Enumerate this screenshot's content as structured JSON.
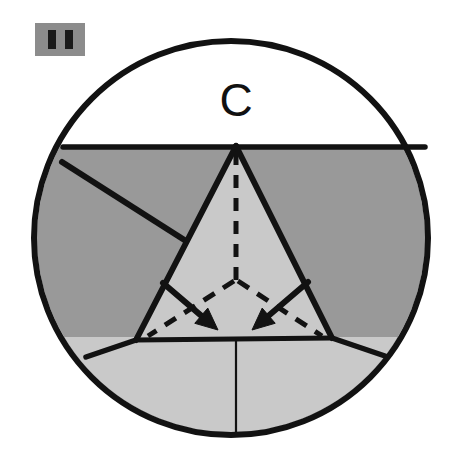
{
  "figure": {
    "step_label": "C",
    "badge": {
      "name": "pause-badge",
      "bars": 2,
      "background_color": "#8c8c8c",
      "bar_color": "#1a1a1a"
    },
    "colors": {
      "outline": "#121212",
      "paper_white": "#ffffff",
      "paper_dark_gray": "#999999",
      "paper_light_gray": "#c9c9c9",
      "dashed_line": "#121212",
      "arrow": "#121212"
    },
    "circle": {
      "name": "outer-circle",
      "center_x": 231,
      "center_y": 238,
      "radius": 197,
      "stroke_width": 6
    },
    "horizontal_fold": {
      "name": "horizontal-fold-line",
      "y": 147,
      "x1": 63,
      "x2": 425
    },
    "triangle": {
      "name": "center-triangle",
      "apex_x": 236,
      "apex_y": 146,
      "left_x": 136,
      "left_y": 340,
      "right_x": 332,
      "right_y": 338
    },
    "diagonal_fold_left": {
      "name": "left-diagonal-fold",
      "x1": 62,
      "y1": 162,
      "x2": 186,
      "y2": 241
    },
    "lower_left_fold": {
      "name": "lower-left-fold",
      "x1": 136,
      "y1": 340,
      "x2": 86,
      "y2": 357
    },
    "lower_right_fold": {
      "name": "lower-right-fold",
      "x1": 332,
      "y1": 338,
      "x2": 385,
      "y2": 356
    },
    "center_vertical_line": {
      "name": "center-vertical-line",
      "x": 236,
      "y1": 341,
      "y2": 432
    },
    "dashed_lines": [
      {
        "name": "dashed-center-vertical",
        "x1": 236,
        "y1": 152,
        "x2": 236,
        "y2": 281
      },
      {
        "name": "dashed-branch-left",
        "x1": 234,
        "y1": 281,
        "x2": 148,
        "y2": 336
      },
      {
        "name": "dashed-branch-right",
        "x1": 238,
        "y1": 281,
        "x2": 322,
        "y2": 336
      }
    ],
    "arrows": [
      {
        "name": "fold-arrow-left",
        "x1": 163,
        "y1": 283,
        "x2": 218,
        "y2": 330,
        "direction": "down-right"
      },
      {
        "name": "fold-arrow-right",
        "x1": 308,
        "y1": 282,
        "x2": 252,
        "y2": 330,
        "direction": "down-left"
      }
    ]
  }
}
